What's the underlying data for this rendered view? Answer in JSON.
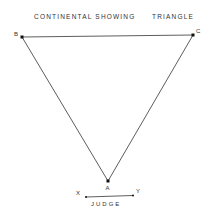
{
  "title": {
    "left": "CONTINENTAL SHOWING",
    "right": "TRIANGLE"
  },
  "points": {
    "A": {
      "label": "A",
      "x": 108,
      "y": 181
    },
    "B": {
      "label": "B",
      "x": 22,
      "y": 37
    },
    "C": {
      "label": "C",
      "x": 193,
      "y": 35
    }
  },
  "judge_line": {
    "x_label": "X",
    "y_label": "Y",
    "caption": "JUDGE"
  },
  "colors": {
    "line": "#333333",
    "point": "#111111",
    "background": "#ffffff"
  }
}
